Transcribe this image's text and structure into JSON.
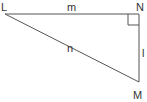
{
  "diagram": {
    "type": "right-triangle",
    "vertices": [
      {
        "label": "L"
      },
      {
        "label": "N",
        "right_angle": true
      },
      {
        "label": "M"
      }
    ],
    "sides": [
      {
        "label": "m",
        "between": [
          "L",
          "N"
        ]
      },
      {
        "label": "l",
        "between": [
          "N",
          "M"
        ]
      },
      {
        "label": "n",
        "between": [
          "L",
          "M"
        ]
      }
    ],
    "colors": {
      "stroke": "#555555",
      "text": "#333333"
    }
  }
}
